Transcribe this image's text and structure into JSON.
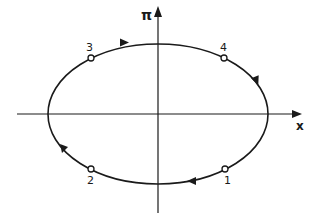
{
  "diagram": {
    "type": "phase-space-orbit",
    "axes": {
      "x_label": "x",
      "y_label": "π"
    },
    "curve": {
      "shape": "ellipse",
      "direction": "clockwise",
      "center": [
        158,
        114
      ],
      "rx": 110,
      "ry": 70
    },
    "points": [
      {
        "label": "1",
        "position": "lower-right"
      },
      {
        "label": "2",
        "position": "lower-left"
      },
      {
        "label": "3",
        "position": "upper-left"
      },
      {
        "label": "4",
        "position": "upper-right"
      }
    ],
    "colors": {
      "line": "#1a1a1a",
      "background": "#ffffff"
    }
  }
}
